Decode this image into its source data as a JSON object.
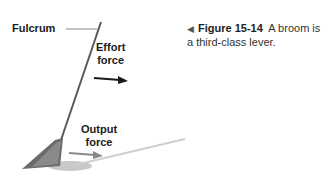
{
  "figure": {
    "labels": {
      "fulcrum": "Fulcrum",
      "effort_line1": "Effort",
      "effort_line2": "force",
      "output_line1": "Output",
      "output_line2": "force"
    },
    "caption": {
      "pointer": "◀",
      "number": "Figure 15-14",
      "text": "A broom is a third-class lever."
    },
    "colors": {
      "handle": "#555555",
      "effort_arrow": "#1a1a1a",
      "output_arrow": "#888888",
      "shadow": "#bbbbbb"
    }
  }
}
